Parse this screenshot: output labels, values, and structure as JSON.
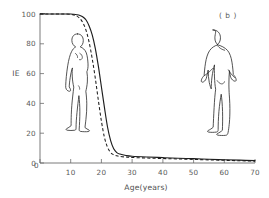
{
  "chart_data": {
    "type": "line",
    "title": "",
    "panel_label": "( b )",
    "xlabel": "Age(years)",
    "ylabel": "IE",
    "xlim": [
      0,
      70
    ],
    "ylim": [
      0,
      100
    ],
    "xticks": [
      0,
      10,
      20,
      30,
      40,
      50,
      60,
      70
    ],
    "yticks": [
      0,
      20,
      40,
      60,
      80,
      100
    ],
    "grid": false,
    "legend": "none",
    "series": [
      {
        "name": "male",
        "style": "solid",
        "annotation": "male-figure",
        "x": [
          0,
          2,
          4,
          6,
          8,
          10,
          11,
          12,
          13,
          14,
          15,
          16,
          17,
          18,
          19,
          20,
          21,
          22,
          23,
          24,
          25,
          26,
          28,
          30,
          35,
          40,
          45,
          50,
          55,
          60,
          65,
          70
        ],
        "y": [
          100,
          100,
          100,
          100,
          100,
          100,
          99.8,
          99.5,
          99,
          98,
          96,
          92,
          86,
          77,
          65,
          51,
          37,
          24,
          15,
          9.5,
          7,
          6,
          5,
          4.5,
          4,
          3.6,
          3.2,
          2.9,
          2.5,
          2.2,
          1.9,
          1.6
        ]
      },
      {
        "name": "female",
        "style": "dashed",
        "annotation": "female-figure",
        "x": [
          0,
          2,
          4,
          6,
          8,
          10,
          11,
          12,
          13,
          14,
          15,
          16,
          17,
          18,
          19,
          20,
          21,
          22,
          23,
          24,
          25,
          26,
          28,
          30,
          35,
          40,
          45,
          50,
          55,
          60,
          65,
          70
        ],
        "y": [
          100,
          100,
          100,
          100,
          100,
          99.8,
          99.4,
          98.6,
          97,
          94,
          89,
          81,
          70,
          57,
          42,
          28,
          17,
          10.5,
          7,
          5.5,
          4.8,
          4.4,
          4,
          3.7,
          3.3,
          3,
          2.7,
          2.4,
          2.1,
          1.8,
          1.5,
          1.2
        ]
      }
    ]
  },
  "annotations": {
    "female_figure_name": "female-silhouette",
    "male_figure_name": "male-silhouette"
  },
  "axis": {
    "x_tick_labels": [
      "0",
      "10",
      "20",
      "30",
      "40",
      "50",
      "60",
      "70"
    ],
    "y_tick_labels": [
      "0",
      "20",
      "40",
      "60",
      "80",
      "100"
    ]
  }
}
